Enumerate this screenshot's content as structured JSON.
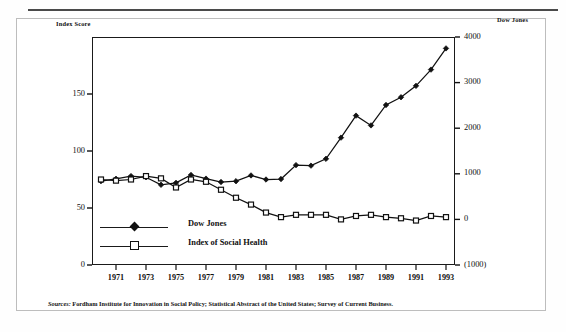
{
  "chart_data": {
    "type": "line",
    "title": "",
    "xlabel": "",
    "ylabel": "Index Score",
    "y2label": "Dow Jones",
    "grid": false,
    "legend_position": "inside-lower-left",
    "x": [
      1970,
      1971,
      1972,
      1973,
      1974,
      1975,
      1976,
      1977,
      1978,
      1979,
      1980,
      1981,
      1982,
      1983,
      1984,
      1985,
      1986,
      1987,
      1988,
      1989,
      1990,
      1991,
      1992,
      1993
    ],
    "xtick_labels": [
      "1971",
      "1973",
      "1975",
      "1977",
      "1979",
      "1981",
      "1983",
      "1985",
      "1987",
      "1989",
      "1991",
      "1993"
    ],
    "xtick_values": [
      1971,
      1973,
      1975,
      1977,
      1979,
      1981,
      1983,
      1985,
      1987,
      1989,
      1991,
      1993
    ],
    "xlim": [
      1969.4,
      1993.6
    ],
    "ylim": [
      0,
      200
    ],
    "ytick_labels": [
      "0",
      "50",
      "100",
      "150"
    ],
    "ytick_values": [
      0,
      50,
      100,
      150
    ],
    "y2lim": [
      -1000,
      4000
    ],
    "y2tick_labels": [
      "(1000)",
      "0",
      "1000",
      "2000",
      "3000",
      "4000"
    ],
    "y2tick_values": [
      -1000,
      0,
      1000,
      2000,
      3000,
      4000
    ],
    "series": [
      {
        "name": "Dow Jones",
        "axis": "right",
        "marker": "filled-diamond",
        "values": [
          839,
          890,
          950,
          924,
          759,
          802,
          974,
          894,
          820,
          838,
          964,
          875,
          885,
          1190,
          1179,
          1329,
          1793,
          2276,
          2061,
          2509,
          2679,
          2929,
          3285,
          3750
        ]
      },
      {
        "name": "Index of Social Health",
        "axis": "left",
        "marker": "open-square",
        "values": [
          75,
          74,
          75,
          78,
          76,
          68,
          75,
          73,
          66,
          59,
          53,
          46,
          42,
          44,
          44,
          44,
          40,
          43,
          44,
          42,
          41,
          39,
          43,
          42
        ]
      }
    ],
    "source_note": {
      "label": "Sources:",
      "text": " Fordham Institute for Innovation in Social Policy; Statistical Abstract of the United States; Survey of Current Business."
    },
    "colors": {
      "ink": "#111111",
      "frame": "#1a1a1a",
      "outer_frame": "#bdbdbd",
      "rule": "#4a4a4a",
      "background": "#ffffff"
    }
  }
}
